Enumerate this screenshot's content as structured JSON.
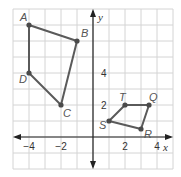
{
  "diagram": {
    "type": "coordinate-plane",
    "axes": {
      "x_label": "x",
      "y_label": "y"
    },
    "grid": {
      "x_range": [
        -5,
        5
      ],
      "y_range": [
        -2,
        8
      ],
      "cell_units": 1
    },
    "x_tick_labels": [
      {
        "value": -4,
        "text": "−4"
      },
      {
        "value": -2,
        "text": "−2"
      },
      {
        "value": 2,
        "text": "2"
      },
      {
        "value": 4,
        "text": "4"
      }
    ],
    "y_tick_labels": [
      {
        "value": 2,
        "text": "2"
      },
      {
        "value": 4,
        "text": "4"
      }
    ],
    "figures": [
      {
        "name": "ABCD",
        "vertices": [
          {
            "label": "A",
            "x": -4,
            "y": 7
          },
          {
            "label": "B",
            "x": -1,
            "y": 6
          },
          {
            "label": "C",
            "x": -2,
            "y": 2
          },
          {
            "label": "D",
            "x": -4,
            "y": 4
          }
        ]
      },
      {
        "name": "STQR",
        "vertices": [
          {
            "label": "S",
            "x": 1,
            "y": 1
          },
          {
            "label": "T",
            "x": 2,
            "y": 2
          },
          {
            "label": "Q",
            "x": 3.5,
            "y": 2
          },
          {
            "label": "R",
            "x": 3,
            "y": 0.5
          }
        ]
      }
    ],
    "colors": {
      "grid": "#d4d4d4",
      "axis": "#222222",
      "figure": "#5a5a5a"
    }
  }
}
